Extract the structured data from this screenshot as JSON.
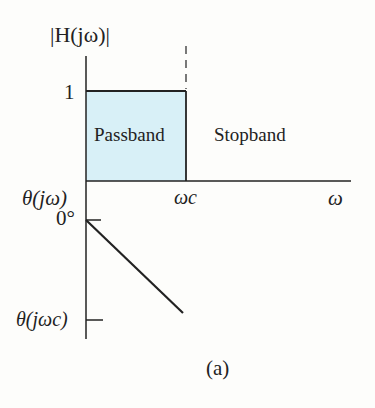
{
  "figure": {
    "magnitude_label": "|H(jω)|",
    "magnitude_tick": "1",
    "passband_label": "Passband",
    "stopband_label": "Stopband",
    "phase_label": "θ(jω)",
    "phase_zero_label": "0°",
    "cutoff_label": "ωc",
    "freq_label": "ω",
    "phase_at_cutoff_label": "θ(jωc)",
    "caption": "(a)",
    "passband_color": "#d8f0f7",
    "line_color": "#222222"
  }
}
